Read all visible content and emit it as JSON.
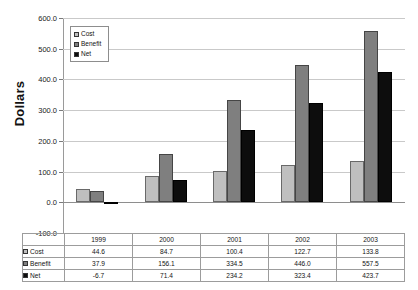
{
  "chart_data": {
    "type": "bar",
    "title": "",
    "xlabel": "",
    "ylabel": "Dollars",
    "categories": [
      "1999",
      "2000",
      "2001",
      "2002",
      "2003"
    ],
    "series": [
      {
        "name": "Cost",
        "values": [
          44.6,
          84.7,
          100.4,
          122.7,
          133.8
        ],
        "color": "#bfbfbf"
      },
      {
        "name": "Benefit",
        "values": [
          37.9,
          156.1,
          334.5,
          446.0,
          557.5
        ],
        "color": "#7f7f7f"
      },
      {
        "name": "Net",
        "values": [
          -6.7,
          71.4,
          234.2,
          323.4,
          423.7
        ],
        "color": "#0d0d0d"
      }
    ],
    "ylim": [
      -100.0,
      600.0
    ],
    "ytick_step": 100.0,
    "ytick_labels": [
      "600.0",
      "500.0",
      "400.0",
      "300.0",
      "200.0",
      "100.0",
      "0.0",
      "-100.0"
    ],
    "ytick_values": [
      600.0,
      500.0,
      400.0,
      300.0,
      200.0,
      100.0,
      0.0,
      -100.0
    ],
    "grid": true,
    "legend_position": "upper-left-inside",
    "has_data_table": true
  },
  "axis": {
    "y_title": "Dollars"
  },
  "legend": {
    "items": [
      {
        "label": "Cost"
      },
      {
        "label": "Benefit"
      },
      {
        "label": "Net"
      }
    ]
  },
  "table": {
    "corner": "",
    "columns": [
      "1999",
      "2000",
      "2001",
      "2002",
      "2003"
    ],
    "rows": [
      {
        "label": "Cost",
        "values": [
          "44.6",
          "84.7",
          "100.4",
          "122.7",
          "133.8"
        ]
      },
      {
        "label": "Benefit",
        "values": [
          "37.9",
          "156.1",
          "334.5",
          "446.0",
          "557.5"
        ]
      },
      {
        "label": "Net",
        "values": [
          "-6.7",
          "71.4",
          "234.2",
          "323.4",
          "423.7"
        ]
      }
    ]
  }
}
